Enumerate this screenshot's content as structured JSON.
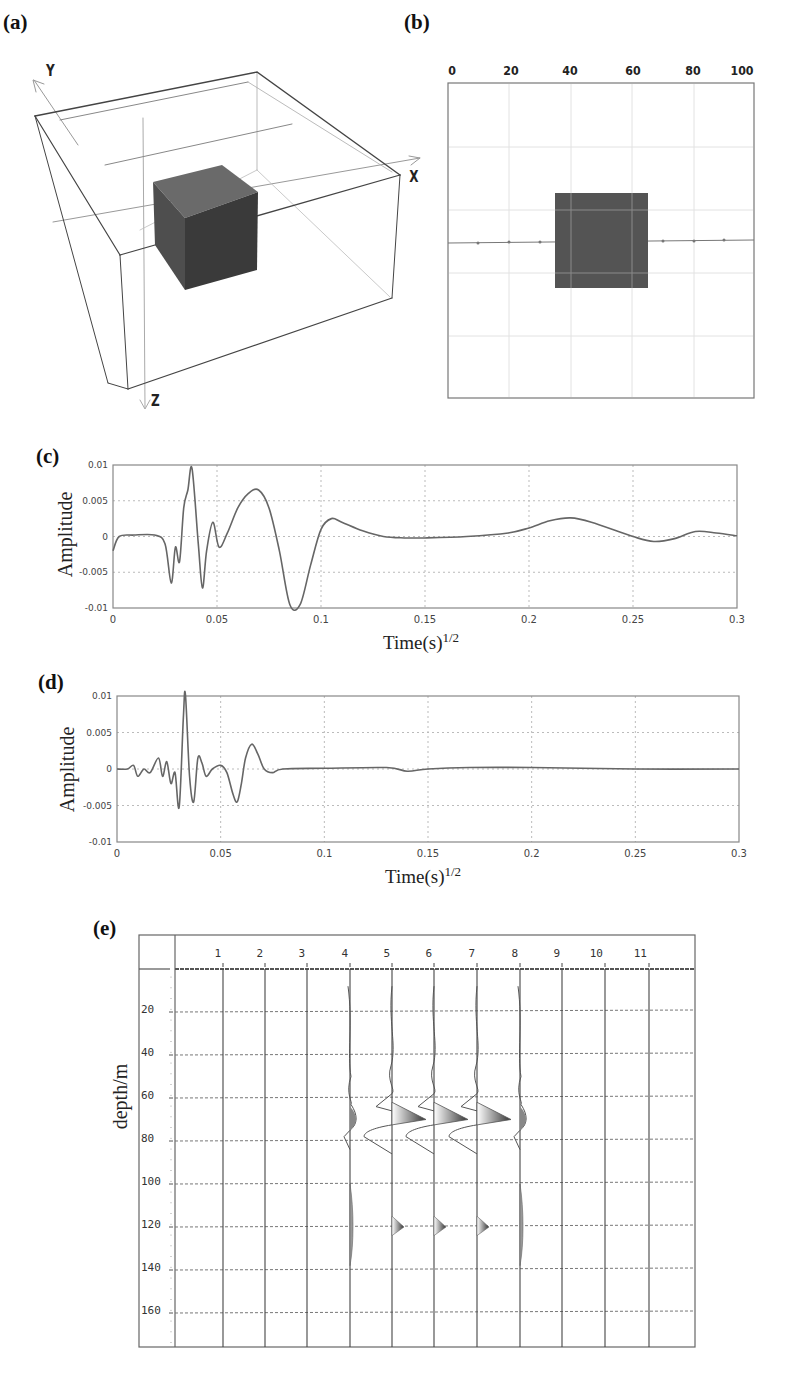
{
  "panels": {
    "a": {
      "label": "(a)",
      "axes": {
        "x": "X",
        "y": "Y",
        "z": "Z"
      },
      "description": "3D model box with a cubic anomaly at the center"
    },
    "b": {
      "label": "(b)",
      "x_ticks": [
        "0",
        "20",
        "40",
        "60",
        "80",
        "100"
      ],
      "description": "Plan view with square anomaly spanning ~35–65 and survey line across the middle"
    },
    "c": {
      "label": "(c)",
      "ylabel": "Amplitude",
      "xlabel": "Time(s)",
      "xlabel_sup": "1/2",
      "y_ticks": [
        "0.01",
        "0.005",
        "0",
        "-0.005",
        "-0.01"
      ],
      "x_ticks": [
        "0",
        "0.05",
        "0.1",
        "0.15",
        "0.2",
        "0.25",
        "0.3"
      ]
    },
    "d": {
      "label": "(d)",
      "ylabel": "Amplitude",
      "xlabel": "Time(s)",
      "xlabel_sup": "1/2",
      "y_ticks": [
        "0.01",
        "0.005",
        "0",
        "-0.005",
        "-0.01"
      ],
      "x_ticks": [
        "0",
        "0.05",
        "0.1",
        "0.15",
        "0.2",
        "0.25",
        "0.3"
      ]
    },
    "e": {
      "label": "(e)",
      "ylabel": "depth/m",
      "columns": [
        "1",
        "2",
        "3",
        "4",
        "5",
        "6",
        "7",
        "8",
        "9",
        "10",
        "11"
      ],
      "depths": [
        "20",
        "40",
        "60",
        "80",
        "100",
        "120",
        "140",
        "160"
      ]
    }
  },
  "chart_data": [
    {
      "id": "a",
      "type": "diagram",
      "title": "3D model",
      "axes": [
        "X",
        "Y",
        "Z"
      ]
    },
    {
      "id": "b",
      "type": "diagram",
      "title": "Plan view",
      "xlim": [
        0,
        100
      ],
      "x_ticks": [
        0,
        20,
        40,
        60,
        80,
        100
      ],
      "anomaly_extent_x": [
        35,
        65
      ],
      "anomaly_extent_y": [
        35,
        65
      ],
      "survey_line_y": 50,
      "grid": true
    },
    {
      "id": "c",
      "type": "line",
      "title": "",
      "xlabel": "Time(s)^1/2",
      "ylabel": "Amplitude",
      "xlim": [
        0,
        0.3
      ],
      "ylim": [
        -0.01,
        0.01
      ],
      "grid": true,
      "series": [
        {
          "name": "signal",
          "x": [
            0,
            0.003,
            0.01,
            0.02,
            0.025,
            0.028,
            0.03,
            0.032,
            0.034,
            0.036,
            0.038,
            0.041,
            0.043,
            0.045,
            0.048,
            0.051,
            0.055,
            0.06,
            0.065,
            0.07,
            0.075,
            0.08,
            0.085,
            0.09,
            0.095,
            0.1,
            0.105,
            0.11,
            0.12,
            0.13,
            0.14,
            0.15,
            0.17,
            0.19,
            0.2,
            0.21,
            0.22,
            0.23,
            0.25,
            0.26,
            0.27,
            0.28,
            0.29,
            0.3
          ],
          "values": [
            -0.002,
            0.0,
            0.0002,
            0.0002,
            -0.001,
            -0.0065,
            -0.0015,
            -0.0035,
            0.004,
            0.0065,
            0.0095,
            -0.001,
            -0.0072,
            -0.002,
            0.002,
            -0.0015,
            0.0005,
            0.004,
            0.006,
            0.0065,
            0.004,
            -0.002,
            -0.0095,
            -0.0095,
            -0.004,
            0.001,
            0.0025,
            0.002,
            0.0008,
            0.0,
            -0.0002,
            -0.0002,
            0.0,
            0.0005,
            0.0012,
            0.0022,
            0.0026,
            0.002,
            0.0,
            -0.0007,
            -0.0003,
            0.0007,
            0.0005,
            0.0001
          ]
        }
      ]
    },
    {
      "id": "d",
      "type": "line",
      "title": "",
      "xlabel": "Time(s)^1/2",
      "ylabel": "Amplitude",
      "xlim": [
        0,
        0.3
      ],
      "ylim": [
        -0.01,
        0.01
      ],
      "grid": true,
      "series": [
        {
          "name": "signal",
          "x": [
            0,
            0.005,
            0.008,
            0.01,
            0.013,
            0.016,
            0.02,
            0.022,
            0.024,
            0.026,
            0.028,
            0.03,
            0.032,
            0.033,
            0.035,
            0.037,
            0.039,
            0.041,
            0.043,
            0.046,
            0.05,
            0.053,
            0.056,
            0.058,
            0.06,
            0.062,
            0.065,
            0.068,
            0.071,
            0.075,
            0.08,
            0.1,
            0.13,
            0.14,
            0.15,
            0.17,
            0.2,
            0.25,
            0.3
          ],
          "values": [
            0.0,
            0.0,
            0.0005,
            -0.001,
            0.0,
            -0.0005,
            0.0015,
            -0.001,
            0.001,
            -0.002,
            -0.0005,
            -0.0052,
            0.007,
            0.0102,
            -0.001,
            -0.0045,
            0.0015,
            0.0008,
            -0.001,
            0.0,
            0.0005,
            -0.0005,
            -0.0035,
            -0.0045,
            -0.002,
            0.0015,
            0.0034,
            0.002,
            0.0,
            -0.0005,
            0.0,
            0.0001,
            0.0002,
            -0.0003,
            0.0,
            0.0002,
            0.0002,
            0.0,
            0.0
          ]
        }
      ]
    },
    {
      "id": "e",
      "type": "wiggle",
      "title": "",
      "xlabel": "trace number",
      "ylabel": "depth/m",
      "x_ticks": [
        1,
        2,
        3,
        4,
        5,
        6,
        7,
        8,
        9,
        10,
        11
      ],
      "y_ticks": [
        20,
        40,
        60,
        80,
        100,
        120,
        140,
        160
      ],
      "ylim": [
        0,
        170
      ],
      "grid": true,
      "traces_with_signal": [
        4,
        5,
        6,
        7,
        8
      ],
      "main_reflection_depth_m": 70,
      "secondary_reflection_depth_m": 120
    }
  ]
}
